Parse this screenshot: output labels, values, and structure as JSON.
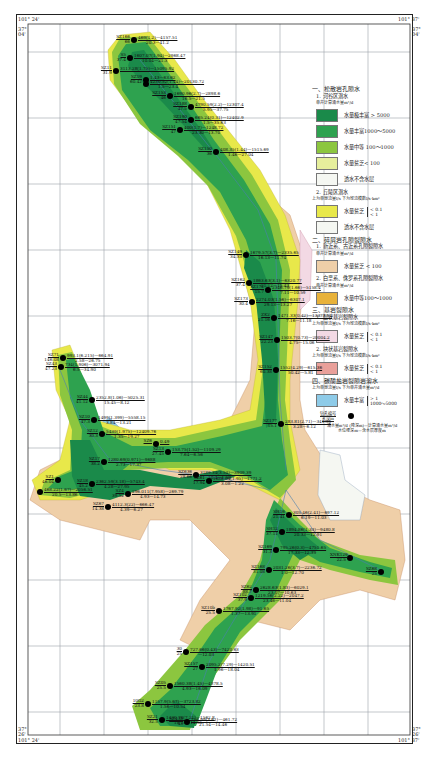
{
  "coords": {
    "top_left_lon": "101° 24'",
    "top_right_lon": "101° 37'",
    "top_left_lat": "37°\n04'",
    "top_right_lat": "37°\n04'",
    "bottom_left_lat": "37°\n26'",
    "bottom_right_lat": "37°\n26'",
    "bottom_left_lon": "101° 24'",
    "bottom_right_lon": "101° 37'"
  },
  "colors": {
    "very_rich": "#1a8a4a",
    "rich": "#2ea24f",
    "medium": "#8cc63f",
    "poor": "#e6ef9c",
    "non_aquifer": "#f5f7f2",
    "hill_poor": "#e8e84a",
    "clastic_poor": "#efcfa8",
    "clastic_medium": "#e8b23a",
    "bedrock_layer": "#f3d9e4",
    "bedrock_band": "#e9a09a",
    "carbonate": "#8ecbe8",
    "grid": "#9aa3a8",
    "river": "#4a7fb0"
  },
  "legend": {
    "s1_title": "一、松散岩孔隙水",
    "s1_1_title": "1. 河谷区潜水",
    "s1_1_sub": "单井计算涌水量m³/d",
    "s1_items": [
      {
        "label": "水量极丰富 > 5000"
      },
      {
        "label": "水量丰富1000～5000"
      },
      {
        "label": "水量中等 100～1000"
      },
      {
        "label": "水量贫乏< 100"
      },
      {
        "label": "透水不含水层"
      }
    ],
    "s1_2_title": "2. 丘陵区潜水",
    "s1_2_sub": "上为单泉流量l/s  下为径流模数l/s·km²",
    "s1_2_items": [
      {
        "label": "水量贫乏",
        "values": "< 0.1\n< 1"
      },
      {
        "label": "透水不含水层"
      }
    ],
    "s2_title": "二、碎屑岩孔隙裂隙水",
    "s2_1_title": "1. 新近系、古近系孔隙裂隙水",
    "s2_1_sub": "单井计算涌水量m³/d",
    "s2_1_item": {
      "label": "水量贫乏 < 100"
    },
    "s2_2_title": "2. 白垩系、侏罗系孔隙裂隙水",
    "s2_2_sub": "单井计算涌水量m³/d",
    "s2_2_item": {
      "label": "水量中等100～1000"
    },
    "s3_title": "三、基岩裂隙水",
    "s3_1_title": "1. 层状基岩裂隙水",
    "s3_1_sub": "上为单泉流量l/s  下为径流模数l/s·km²",
    "s3_1_item": {
      "label": "水量贫乏",
      "values": "< 0.1\n< 1"
    },
    "s3_2_title": "2. 块状基岩裂隙水",
    "s3_2_sub": "上为单泉流量l/s  下为径流模数l/s·km²",
    "s3_2_item": {
      "label": "水量贫乏",
      "values": "< 0.1\n< 1"
    },
    "s4_title": "四、碳酸盐岩裂隙岩溶水",
    "s4_sub": "上为单泉流量l/s  下为单井涌水量m³/d",
    "s4_item": {
      "label": "水量丰富",
      "values": "> 1\n1000～5000"
    },
    "well_label": "钻孔编号\n孔深m",
    "well_note": "涌水量m³/d (降深m)—计算涌水量m³/d\n水位埋深m—含水层厚度m"
  },
  "wells": [
    {
      "id": "SZ166",
      "depth": "66",
      "data": "469(1.2)—4157.51",
      "sub": "20.3—41.2",
      "x": 134,
      "y": 40
    },
    {
      "id": "S5",
      "depth": "37.4",
      "data": "1607.07(1.94)—2968.47",
      "sub": "10.04—21.3",
      "x": 130,
      "y": 58
    },
    {
      "id": "SZ11",
      "depth": "31.9",
      "data": "3113.28(1.75)—15095.92",
      "sub": "",
      "x": 116,
      "y": 71
    },
    {
      "id": "SZ19",
      "depth": "60.42",
      "data": "1.43—63.62",
      "sub": "",
      "x": 146,
      "y": 80
    },
    {
      "id": "",
      "depth": "",
      "data": "4230.52(1.44)—20130.72",
      "sub": "1.5—23.4",
      "x": 146,
      "y": 84
    },
    {
      "id": "SZ153",
      "depth": "46",
      "data": "1690.96(2.7)—2898.6",
      "sub": "16.5—21.5",
      "x": 170,
      "y": 96
    },
    {
      "id": "SZ188",
      "depth": "47.5",
      "data": "4790.59(2.2)—12307.4",
      "sub": "5.95—37.75",
      "x": 191,
      "y": 107
    },
    {
      "id": "SZ190",
      "depth": "47.54",
      "data": "665.24(0.31)—12402.9",
      "sub": "1.5—35.63",
      "x": 191,
      "y": 120
    },
    {
      "id": "SZ151",
      "depth": "47",
      "data": "400(1.7)—1248.72",
      "sub": "23.30—13.70",
      "x": 180,
      "y": 130
    },
    {
      "id": "SZ150",
      "depth": "36",
      "data": "408.35(1.44)—1515.69",
      "sub": "1.46—27.04",
      "x": 216,
      "y": 152
    },
    {
      "id": "SZ149",
      "depth": "34.33",
      "data": "1679.57(3.7)—2335.65",
      "sub": "16.13—11.74",
      "x": 246,
      "y": 255
    },
    {
      "id": "SZ162",
      "depth": "37.4",
      "data": "1863.63(3.1)—6320.77",
      "sub": "21.12—15.43",
      "x": 249,
      "y": 283
    },
    {
      "id": "SZ172",
      "depth": "15.7",
      "data": "2346.79(1.66)—5158.4",
      "sub": "7.11—10.59",
      "x": 268,
      "y": 290
    },
    {
      "id": "SZ173",
      "depth": "30.4",
      "data": "2274.03(1.56)—6307.1",
      "sub": "29.13—13.27",
      "x": 252,
      "y": 302
    },
    {
      "id": "ZK2",
      "depth": "21.16",
      "data": "1471.33(0.42)—13373.11",
      "sub": "7.16—11.18",
      "x": 274,
      "y": 318
    },
    {
      "id": "SZ147",
      "depth": "22.23",
      "data": "1503.7(0.73)—20004.2",
      "sub": "4.75—15.06",
      "x": 277,
      "y": 340
    },
    {
      "id": "SZ152",
      "depth": "60.38",
      "data": "1552(4.29)—615.36",
      "sub": "50.42—5.81",
      "x": 276,
      "y": 370
    },
    {
      "id": "SZ177",
      "depth": "15.1",
      "data": "283.81(2.71)—341.36",
      "sub": "3.28—6.12",
      "x": 281,
      "y": 424
    },
    {
      "id": "SZ71",
      "depth": "146.08",
      "data": "993.1(6.215)—664.91",
      "sub": "2.58—26.75",
      "x": 63,
      "y": 358
    },
    {
      "id": "SZ43",
      "depth": "47.23",
      "data": "734(1.906)—3071.94",
      "sub": "6.5—34.90",
      "x": 61,
      "y": 367
    },
    {
      "id": "SZ44",
      "depth": "41.12",
      "data": "2352.8(1.06)—5025.31",
      "sub": "15.45—8.12",
      "x": 92,
      "y": 400
    },
    {
      "id": "SZ10",
      "depth": "47.3",
      "data": "1499(1.399)—5558.15",
      "sub": "3.84—13.21",
      "x": 94,
      "y": 420
    },
    {
      "id": "SZ12",
      "depth": "30.3",
      "data": "5439(1.975)—12409.76",
      "sub": "1.35—19.27",
      "x": 102,
      "y": 434
    },
    {
      "id": "SZ17",
      "depth": "38.2",
      "data": "1280.69(0.971)—9688",
      "sub": "2.73—17.37",
      "x": 104,
      "y": 462
    },
    {
      "id": "SZ1",
      "depth": "46.04",
      "data": "",
      "sub": "",
      "x": 58,
      "y": 480
    },
    {
      "id": "SZ18",
      "depth": "45.2",
      "data": "2362.59(3.18)—5743.4",
      "sub": "4.28—27.95",
      "x": 92,
      "y": 484
    },
    {
      "id": "",
      "depth": "",
      "data": "468.22(1.67)—2056.51",
      "sub": "20.5—13.86",
      "x": 40,
      "y": 492
    },
    {
      "id": "SZ4",
      "depth": "39.52",
      "data": "296.011(7.958)—269.79",
      "sub": "4.93—14.73",
      "x": 128,
      "y": 494
    },
    {
      "id": "SZ67",
      "depth": "14.38",
      "data": "4112.3(22)—666.47",
      "sub": "4.39—6.27",
      "x": 108,
      "y": 507
    },
    {
      "id": "SZ13",
      "depth": "27.45",
      "data": "153.75(1.52)—1109.29",
      "sub": "7.64—6.56",
      "x": 168,
      "y": 452
    },
    {
      "id": "SZ6",
      "depth": "",
      "data": "0.49",
      "sub": "",
      "x": 156,
      "y": 444
    },
    {
      "id": "SZ636",
      "depth": "28.66",
      "data": "3189.34(3.54)—3909.39",
      "sub": "10.4—1.50",
      "x": 196,
      "y": 475
    },
    {
      "id": "SZ61",
      "depth": "17.94",
      "data": "1886.04(1.95)—1771.2",
      "sub": "3.08—1.22",
      "x": 209,
      "y": 481
    },
    {
      "id": "SH16",
      "depth": "21.41",
      "data": "305.46(2.41)—697.12",
      "sub": "6.19—11.03",
      "x": 289,
      "y": 515
    },
    {
      "id": "SH12",
      "depth": "37.11",
      "data": "1894.86(1.33)—9480.8",
      "sub": "20.33—12.91",
      "x": 282,
      "y": 532
    },
    {
      "id": "SZ169",
      "depth": "31.3",
      "data": "795.26(0.3)—4751.65",
      "sub": "17.33—12.39",
      "x": 276,
      "y": 550
    },
    {
      "id": "XNK129",
      "depth": "22.5",
      "data": "",
      "sub": "",
      "x": 350,
      "y": 558
    },
    {
      "id": "SZ68",
      "depth": "25",
      "data": "",
      "sub": "",
      "x": 381,
      "y": 572
    },
    {
      "id": "SZ168",
      "depth": "31.08",
      "data": "2031.26(3.7)—2236.72",
      "sub": "1.0—12.70",
      "x": 269,
      "y": 570
    },
    {
      "id": "SZ62",
      "depth": "88.7",
      "data": "2628.63(1.83)—6029.1",
      "sub": "23.07—10.63",
      "x": 256,
      "y": 590
    },
    {
      "id": "SZ102",
      "depth": "37.9",
      "data": "1219.56(2.22)—2047.2",
      "sub": "23.46—11.04",
      "x": 251,
      "y": 598
    },
    {
      "id": "SZ10b",
      "depth": "25.5",
      "data": "1767.92(1.98)—91.65",
      "sub": "1.37—13.91",
      "x": 219,
      "y": 611
    },
    {
      "id": "30",
      "depth": "25",
      "data": "727.66(0.43)—7420.63",
      "sub": "—12.03",
      "x": 186,
      "y": 652
    },
    {
      "id": "SZ157",
      "depth": "27",
      "data": "2095.2(7.29)—1420.51",
      "sub": "1.96—18.04",
      "x": 202,
      "y": 667
    },
    {
      "id": "SZ05",
      "depth": "25.5",
      "data": "1560.38(1.45)—4378.5",
      "sub": "4.93—16.09",
      "x": 170,
      "y": 686
    },
    {
      "id": "10G2",
      "depth": "23.8",
      "data": "1157.9(5.67)—3723.82",
      "sub": "1.56—10.54",
      "x": 148,
      "y": 704
    },
    {
      "id": "SZ21",
      "depth": "32.5",
      "data": "1430.76(7.21)—1562.8",
      "sub": "18.15—14.35",
      "x": 162,
      "y": 720
    },
    {
      "id": "SZ43b",
      "depth": "43",
      "data": "756.99(3.61)—461.72",
      "sub": "21.54—14.46",
      "x": 187,
      "y": 722
    }
  ]
}
